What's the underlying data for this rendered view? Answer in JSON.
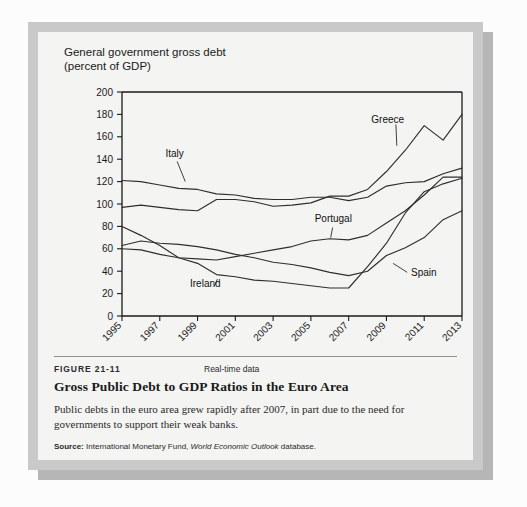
{
  "figure": {
    "number": "FIGURE 21-11",
    "realtime": "Real-time data",
    "title": "Gross Public Debt to GDP Ratios in the Euro Area",
    "description": "Public debts in the euro area grew rapidly after 2007, in part due to the need for governments to support their weak banks.",
    "source_label": "Source:",
    "source_text_1": "International Monetary Fund,",
    "source_text_italic": "World Economic Outlook",
    "source_text_2": "database."
  },
  "chart_data": {
    "type": "line",
    "title": "General government gross debt\n(percent of GDP)",
    "axis_title_line1": "General government gross debt",
    "axis_title_line2": "(percent of GDP)",
    "xlabel": "",
    "ylabel": "percent of GDP",
    "grid": false,
    "legend_position": "inline-annotations",
    "ylim": [
      0,
      200
    ],
    "yticks": [
      0,
      20,
      40,
      60,
      80,
      100,
      120,
      140,
      160,
      180,
      200
    ],
    "xlim": [
      1995,
      2013
    ],
    "xticks": [
      1995,
      1997,
      1999,
      2001,
      2003,
      2005,
      2007,
      2009,
      2011,
      2013
    ],
    "xtick_labels": [
      "1995",
      "1997",
      "1999",
      "2001",
      "2003",
      "2005",
      "2007",
      "2009",
      "2011",
      "2013"
    ],
    "x": [
      1995,
      1996,
      1997,
      1998,
      1999,
      2000,
      2001,
      2002,
      2003,
      2004,
      2005,
      2006,
      2007,
      2008,
      2009,
      2010,
      2011,
      2012,
      2013
    ],
    "series": [
      {
        "name": "Greece",
        "label": "Greece",
        "values": [
          97,
          99,
          97,
          95,
          94,
          104,
          104,
          102,
          98,
          99,
          101,
          107,
          107,
          113,
          129,
          148,
          170,
          157,
          180
        ]
      },
      {
        "name": "Italy",
        "label": "Italy",
        "values": [
          121,
          120,
          117,
          114,
          113,
          109,
          108,
          105,
          104,
          104,
          106,
          106,
          103,
          106,
          116,
          119,
          120,
          127,
          132
        ]
      },
      {
        "name": "Portugal",
        "label": "Portugal",
        "values": [
          60,
          59,
          55,
          52,
          51,
          50,
          53,
          56,
          59,
          62,
          67,
          69,
          68,
          72,
          83,
          94,
          108,
          124,
          124
        ]
      },
      {
        "name": "Ireland",
        "label": "Ireland",
        "values": [
          80,
          72,
          63,
          52,
          47,
          37,
          35,
          32,
          31,
          29,
          27,
          25,
          25,
          44,
          65,
          92,
          111,
          118,
          123
        ]
      },
      {
        "name": "Spain",
        "label": "Spain",
        "values": [
          63,
          67,
          65,
          64,
          62,
          59,
          55,
          52,
          48,
          46,
          43,
          39,
          36,
          40,
          54,
          61,
          70,
          86,
          94
        ]
      }
    ],
    "annotations": [
      {
        "text": "Greece",
        "x": 2008.2,
        "y": 172
      },
      {
        "text": "Italy",
        "x": 1997.3,
        "y": 142
      },
      {
        "text": "Portugal",
        "x": 2005.2,
        "y": 84
      },
      {
        "text": "Ireland",
        "x": 1998.6,
        "y": 26
      },
      {
        "text": "Spain",
        "x": 2010.3,
        "y": 36
      }
    ]
  },
  "colors": {
    "frame": "#c9c9c9",
    "panel": "#f4f4f3",
    "line": "#2e2e2e",
    "text": "#1a1a1a",
    "shadow": "#b6b6b6"
  }
}
